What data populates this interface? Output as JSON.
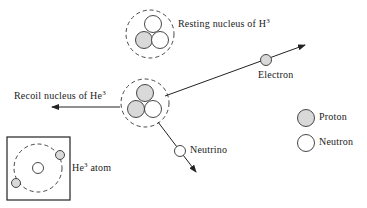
{
  "labels": {
    "resting": {
      "text": "Resting nucleus of H",
      "sup": "3"
    },
    "recoil": {
      "text": "Recoil nucleus of He",
      "sup": "3"
    },
    "electron": "Electron",
    "neutrino": "Neutrino",
    "atom": {
      "text": "He",
      "sup": "3",
      "suffix": " atom"
    }
  },
  "legend": [
    {
      "label": "Proton",
      "fill": "#d9d9d9"
    },
    {
      "label": "Neutron",
      "fill": "#ffffff"
    }
  ],
  "colors": {
    "proton": "#d9d9d9",
    "neutron": "#ffffff",
    "stroke": "#2a2a2a"
  }
}
